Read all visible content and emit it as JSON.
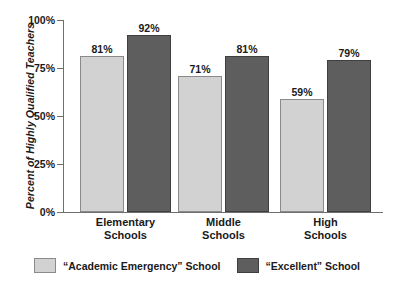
{
  "chart_data": {
    "type": "bar",
    "title": "",
    "xlabel": "",
    "ylabel": "Percent of Highly Qualified Teachers",
    "ylim": [
      0,
      100
    ],
    "yticks": [
      "0%",
      "25%",
      "50%",
      "75%",
      "100%"
    ],
    "ytick_values": [
      0,
      25,
      50,
      75,
      100
    ],
    "grid": false,
    "legend_position": "bottom",
    "categories": [
      "Elementary\nSchools",
      "Middle\nSchools",
      "High\nSchools"
    ],
    "category_lines": [
      [
        "Elementary",
        "Schools"
      ],
      [
        "Middle",
        "Schools"
      ],
      [
        "High",
        "Schools"
      ]
    ],
    "series": [
      {
        "name": "“Academic Emergency” School",
        "color": "#d2d2d2",
        "values": [
          81,
          71,
          59
        ],
        "labels": [
          "81%",
          "71%",
          "59%"
        ]
      },
      {
        "name": "“Excellent” School",
        "color": "#5e5e5e",
        "values": [
          92,
          81,
          79
        ],
        "labels": [
          "92%",
          "81%",
          "79%"
        ]
      }
    ]
  },
  "axis": {
    "y_title": "Percent of Highly Qualified Teachers",
    "ticks": [
      {
        "label": "100%",
        "value": 100
      },
      {
        "label": "75%",
        "value": 75
      },
      {
        "label": "50%",
        "value": 50
      },
      {
        "label": "25%",
        "value": 25
      },
      {
        "label": "0%",
        "value": 0
      }
    ]
  },
  "groups": [
    {
      "line1": "Elementary",
      "line2": "Schools",
      "light_label": "81%",
      "dark_label": "92%"
    },
    {
      "line1": "Middle",
      "line2": "Schools",
      "light_label": "71%",
      "dark_label": "81%"
    },
    {
      "line1": "High",
      "line2": "Schools",
      "light_label": "59%",
      "dark_label": "79%"
    }
  ],
  "legend": {
    "items": [
      {
        "label": "“Academic Emergency” School",
        "swatch": "light-swatch-icon"
      },
      {
        "label": "“Excellent” School",
        "swatch": "dark-swatch-icon"
      }
    ]
  },
  "colors": {
    "light_bar": "#d2d2d2",
    "dark_bar": "#5e5e5e",
    "axis": "#6f6f6f",
    "text": "#1a1a1a",
    "background": "#ffffff"
  }
}
